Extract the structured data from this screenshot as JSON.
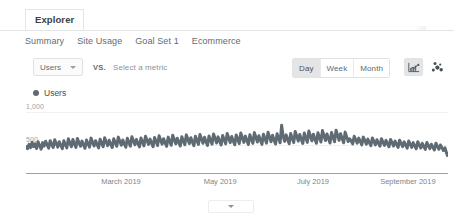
{
  "panel": {
    "tab_label": "Explorer"
  },
  "subnav": {
    "items": [
      {
        "label": "Summary"
      },
      {
        "label": "Site Usage"
      },
      {
        "label": "Goal Set 1"
      },
      {
        "label": "Ecommerce"
      }
    ]
  },
  "controls": {
    "metric_selected": "Users",
    "vs_label": "VS.",
    "secondary_metric_placeholder": "Select a metric",
    "granularity": [
      {
        "label": "Day",
        "selected": true
      },
      {
        "label": "Week",
        "selected": false
      },
      {
        "label": "Month",
        "selected": false
      }
    ],
    "view_icons": [
      {
        "name": "line-chart-icon",
        "selected": true
      },
      {
        "name": "motion-chart-icon",
        "selected": false
      }
    ]
  },
  "legend": {
    "series_label": "Users",
    "series_color": "#5f6b73"
  },
  "footer": {
    "collapse_icon": "chevron-down-icon"
  },
  "chart_data": {
    "type": "line",
    "title": "Users",
    "xlabel": "",
    "ylabel": "Users",
    "ylim": [
      0,
      1000
    ],
    "ytick_labels": [
      "1,000",
      "500"
    ],
    "ytick_values": [
      1000,
      500
    ],
    "grid": true,
    "legend_position": "top-left",
    "xtick_labels": [
      "March 2019",
      "May 2019",
      "July 2019",
      "September 2019"
    ],
    "xtick_positions_pct": [
      22.5,
      46.0,
      68.0,
      90.5
    ],
    "series": [
      {
        "name": "Users",
        "color": "#5f6b73",
        "values": [
          455,
          398,
          470,
          415,
          505,
          432,
          478,
          402,
          512,
          448,
          392,
          498,
          440,
          520,
          462,
          408,
          530,
          470,
          418,
          545,
          482,
          424,
          512,
          455,
          400,
          528,
          468,
          412,
          560,
          492,
          430,
          548,
          478,
          420,
          565,
          500,
          438,
          522,
          460,
          405,
          540,
          480,
          425,
          572,
          505,
          442,
          530,
          468,
          412,
          552,
          490,
          432,
          578,
          512,
          448,
          536,
          472,
          418,
          560,
          498,
          438,
          588,
          520,
          455,
          542,
          478,
          422,
          568,
          502,
          440,
          595,
          528,
          462,
          550,
          485,
          428,
          575,
          510,
          445,
          602,
          535,
          468,
          556,
          490,
          432,
          582,
          515,
          450,
          610,
          540,
          472,
          562,
          495,
          438,
          588,
          522,
          455,
          618,
          548,
          478,
          570,
          502,
          442,
          596,
          528,
          462,
          625,
          555,
          482,
          578,
          508,
          448,
          602,
          535,
          468,
          632,
          560,
          488,
          585,
          515,
          452,
          608,
          540,
          472,
          640,
          568,
          492,
          592,
          520,
          458,
          615,
          545,
          478,
          648,
          575,
          498,
          598,
          528,
          462,
          622,
          552,
          482,
          655,
          580,
          502,
          605,
          532,
          466,
          628,
          558,
          486,
          662,
          588,
          508,
          612,
          538,
          470,
          635,
          562,
          490,
          668,
          592,
          512,
          618,
          542,
          475,
          642,
          568,
          495,
          782,
          600,
          518,
          625,
          548,
          480,
          648,
          572,
          498,
          680,
          605,
          522,
          630,
          552,
          485,
          655,
          578,
          502,
          688,
          610,
          528,
          635,
          558,
          488,
          660,
          582,
          508,
          695,
          615,
          532,
          640,
          562,
          492,
          665,
          588,
          512,
          700,
          620,
          535,
          645,
          568,
          496,
          670,
          592,
          516,
          560,
          525,
          478,
          602,
          548,
          490,
          572,
          518,
          462,
          588,
          532,
          472,
          556,
          500,
          448,
          575,
          520,
          462,
          545,
          492,
          440,
          562,
          508,
          452,
          535,
          482,
          430,
          550,
          498,
          442,
          522,
          470,
          420,
          538,
          485,
          432,
          510,
          458,
          408,
          525,
          472,
          420,
          498,
          445,
          398,
          512,
          460,
          410,
          485,
          435,
          388,
          500,
          448,
          400,
          472,
          425,
          378,
          488,
          436,
          390,
          460,
          415,
          368,
          412,
          330,
          268
        ]
      }
    ]
  }
}
